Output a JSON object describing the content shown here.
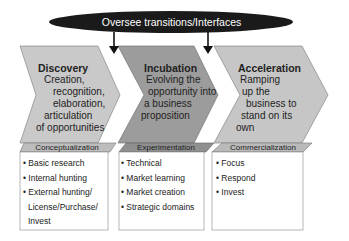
{
  "oversight": {
    "label": "Oversee transitions/Interfaces"
  },
  "stages": [
    {
      "title": "Discovery",
      "description_lines": [
        "Creation,",
        "recognition,",
        "elaboration,",
        "articulation",
        "of opportunities"
      ],
      "phase": "Conceptualization",
      "items": [
        "• Basic research",
        "• Internal hunting",
        "• External hunting/",
        "License/Purchase/",
        "Invest"
      ],
      "color": "#c9c9c9"
    },
    {
      "title": "Incubation",
      "description_lines": [
        "Evolving the",
        "opportunity into",
        "a business",
        "proposition"
      ],
      "phase": "Experimentation",
      "items": [
        "• Technical",
        "• Market learning",
        "• Market creation",
        "• Strategic domains"
      ],
      "color": "#9c9c9c"
    },
    {
      "title": "Acceleration",
      "description_lines": [
        "Ramping",
        "up the",
        "business to",
        "stand on its",
        "own"
      ],
      "phase": "Commercialization",
      "items": [
        "• Focus",
        "• Respond",
        "• Invest"
      ],
      "color": "#c6c6c6"
    }
  ],
  "colors": {
    "oval": "#1a1a1a",
    "outline": "#666666",
    "subheader_light": "#bdbdbd",
    "subheader_dark": "#8f8f8f"
  }
}
